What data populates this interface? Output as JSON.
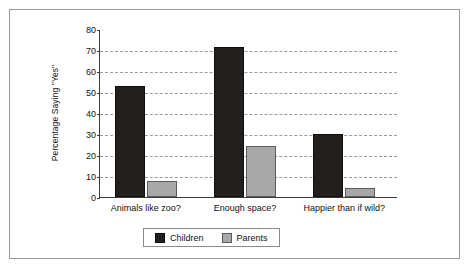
{
  "figure": {
    "background_color": "#ffffff",
    "frame_color": "#9a9a9a"
  },
  "chart_data": {
    "type": "bar",
    "title": "",
    "xlabel": "",
    "ylabel": "Percentage Saying \"Yes\"",
    "ylim": [
      0,
      80
    ],
    "ytick_labels": [
      "0",
      "10",
      "20",
      "30",
      "40",
      "50",
      "60",
      "70",
      "80"
    ],
    "ytick_values": [
      0,
      10,
      20,
      30,
      40,
      50,
      60,
      70,
      80
    ],
    "grid": true,
    "grid_style": "dashed-horizontal",
    "legend_position": "bottom-center",
    "categories": [
      "Animals like zoo?",
      "Enough space?",
      "Happier than if wild?"
    ],
    "series": [
      {
        "name": "Children",
        "color": "#231f1c",
        "values": [
          53,
          71.5,
          30
        ]
      },
      {
        "name": "Parents",
        "color": "#a8a8a8",
        "values": [
          7.5,
          24.5,
          4.5
        ]
      }
    ]
  },
  "legend": {
    "entries": [
      {
        "label": "Children",
        "swatch": "children-swatch"
      },
      {
        "label": "Parents",
        "swatch": "parents-swatch"
      }
    ]
  }
}
